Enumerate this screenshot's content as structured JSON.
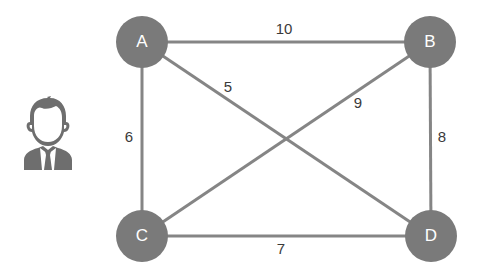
{
  "diagram": {
    "type": "weighted-undirected-graph",
    "colors": {
      "node_fill": "#7a7a7a",
      "node_text": "#ffffff",
      "edge_stroke": "#858585",
      "label_text": "#3a3a3a",
      "person_icon": "#6e6e6e"
    },
    "nodes": [
      {
        "id": "A",
        "label": "A",
        "x": 142,
        "y": 42
      },
      {
        "id": "B",
        "label": "B",
        "x": 430,
        "y": 42
      },
      {
        "id": "C",
        "label": "C",
        "x": 142,
        "y": 236
      },
      {
        "id": "D",
        "label": "D",
        "x": 431,
        "y": 236
      }
    ],
    "edges": [
      {
        "from": "A",
        "to": "B",
        "weight": "10",
        "label_x": 284,
        "label_y": 28
      },
      {
        "from": "A",
        "to": "D",
        "weight": "5",
        "label_x": 228,
        "label_y": 86
      },
      {
        "from": "B",
        "to": "C",
        "weight": "9",
        "label_x": 358,
        "label_y": 102
      },
      {
        "from": "A",
        "to": "C",
        "weight": "6",
        "label_x": 129,
        "label_y": 136
      },
      {
        "from": "B",
        "to": "D",
        "weight": "8",
        "label_x": 442,
        "label_y": 136
      },
      {
        "from": "C",
        "to": "D",
        "weight": "7",
        "label_x": 281,
        "label_y": 248
      }
    ],
    "icon": "person-businessman-icon"
  }
}
